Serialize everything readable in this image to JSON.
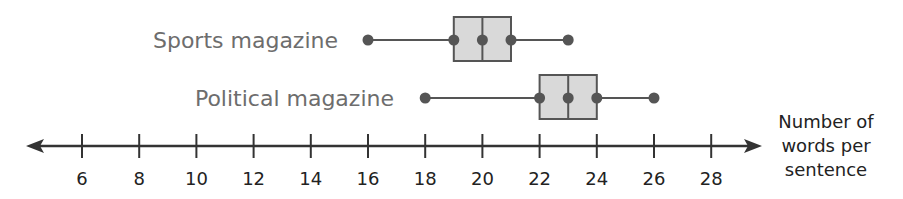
{
  "chart_data": {
    "type": "boxplot",
    "title": "",
    "xlabel": "Number of words per sentence",
    "xlabel_lines": [
      "Number of",
      "words per",
      "sentence"
    ],
    "ylabel": "",
    "xlim": [
      4.5,
      29.5
    ],
    "ticks": [
      6,
      8,
      10,
      12,
      14,
      16,
      18,
      20,
      22,
      24,
      26,
      28
    ],
    "grid": false,
    "legend": "none (series labeled inline at left)",
    "series": [
      {
        "name": "Sports magazine",
        "min": 16,
        "q1": 19,
        "median": 20,
        "q3": 21,
        "max": 23
      },
      {
        "name": "Political magazine",
        "min": 18,
        "q1": 22,
        "median": 23,
        "q3": 24,
        "max": 26
      }
    ]
  },
  "colors": {
    "label_text": "#6d6d6d",
    "axis": "#333333",
    "box_fill": "#d9d9d9",
    "box_stroke": "#555555",
    "whisker": "#555555",
    "point": "#555555"
  }
}
